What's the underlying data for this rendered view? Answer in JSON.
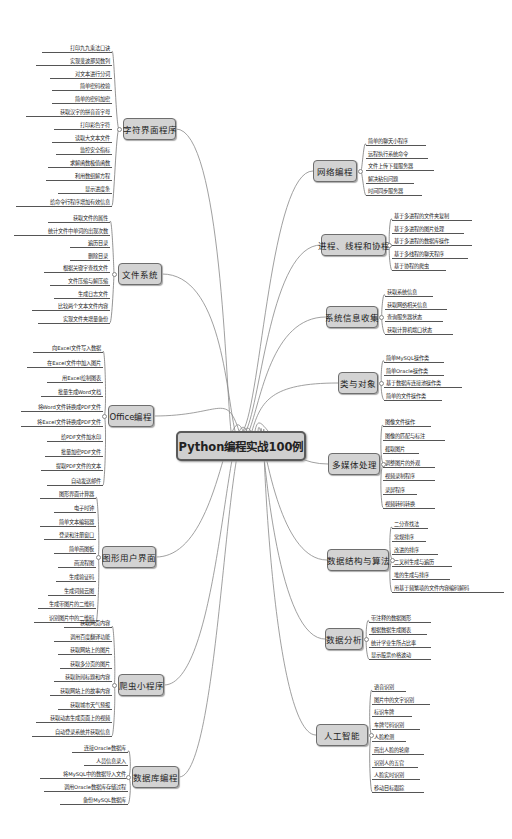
{
  "center": {
    "title": "Python编程实战100例"
  },
  "left_branches": [
    {
      "title": "字符界面程序",
      "items": [
        "打印九九乘法口诀",
        "实现斐波那契数列",
        "对文本进行分词",
        "简单密码校验",
        "简单的密码加密",
        "获取汉字的拼音首字母",
        "打印彩色字符",
        "读取大文本文件",
        "监控安全指标",
        "求解函数极值函数",
        "利用数组解方程",
        "显示进度条",
        "给命令行程序增加有效信息"
      ]
    },
    {
      "title": "文件系统",
      "items": [
        "获取文件的属性",
        "统计文件中单词的出现次数",
        "遍历目录",
        "删除目录",
        "根据关键字查找文件",
        "文件压缩与解压缩",
        "生成日志文件",
        "比较两个文本文件内容",
        "实现文件夹增量备份"
      ]
    },
    {
      "title": "Office编程",
      "items": [
        "向Excel文件写入数据",
        "在Excel文件中加入图片",
        "用Excel绘制图表",
        "批量生成Word文档",
        "将Word文件转换成PDF文件",
        "将Excel文件转换成PDF文件",
        "给PDF文件加水印",
        "批量加密PDF文件",
        "提取PDF文件的文本",
        "自动发送邮件"
      ]
    },
    {
      "title": "图形用户界面",
      "items": [
        "图形界面计算器",
        "电子时钟",
        "简单文本编辑器",
        "登录和注册窗口",
        "简单画图板",
        "画流程图",
        "生成验证码",
        "生成词频云图",
        "生成带图片的二维码",
        "识别图片中的二维码"
      ]
    },
    {
      "title": "爬虫小程序",
      "items": [
        "获取网页内容",
        "调用百度翻译功能",
        "获取网站上的图片",
        "获取多分页的图片",
        "获取新闻标题和内容",
        "获取网站上的故事内容",
        "获取城市天气预报",
        "获取动态生成页面上的视频",
        "自动登录系统并获取信息"
      ]
    },
    {
      "title": "数据库编程",
      "items": [
        "连接Oracle数据库",
        "人员信息录入",
        "将MySQL中的数据导入文件",
        "调用Oracle数据库存储过程",
        "备份MySQL数据库"
      ]
    }
  ],
  "right_branches": [
    {
      "title": "网络编程",
      "items": [
        "简单的聊天小程序",
        "远程执行系统命令",
        "文件上传下载服务器",
        "解决粘包问题",
        "时间同步服务器"
      ]
    },
    {
      "title": "进程、线程和协程",
      "items": [
        "基于多进程的文件夹复制",
        "基于多进程的图片处理",
        "基于多进程的数据库操作",
        "基于多线程的聊天程序",
        "基于协程的爬虫"
      ]
    },
    {
      "title": "系统信息收集",
      "items": [
        "获取系统信息",
        "获取网络相关信息",
        "查询服务器状态",
        "获取计算机端口状态"
      ]
    },
    {
      "title": "类与对象",
      "items": [
        "简单MySQL操作类",
        "简单Oracle操作类",
        "基于数据库连接池操作类",
        "简单的文件操作类"
      ]
    },
    {
      "title": "多媒体处理",
      "items": [
        "图像文件操作",
        "图像的匹配与标注",
        "截取图片",
        "调整图片的外观",
        "视频录制程序",
        "录屏程序",
        "视频转码转换"
      ]
    },
    {
      "title": "数据结构与算法",
      "items": [
        "二分查找法",
        "常规排序",
        "改进的排序",
        "二叉树生成与遍历",
        "堆的生成与排序",
        "用基于频繁项的文件内容编码解码"
      ]
    },
    {
      "title": "数据分析",
      "items": [
        "带注释的数据图形",
        "根据数据生成图表",
        "统计学业生所占比率",
        "显示股票价格波动"
      ]
    },
    {
      "title": "人工智能",
      "items": [
        "语音识别",
        "图片中的文字识别",
        "标识车牌",
        "车牌号码识别",
        "人脸检测",
        "画出人脸的轮廓",
        "识别人的五官",
        "人脸实时识别",
        "移动目标跟踪"
      ]
    }
  ]
}
